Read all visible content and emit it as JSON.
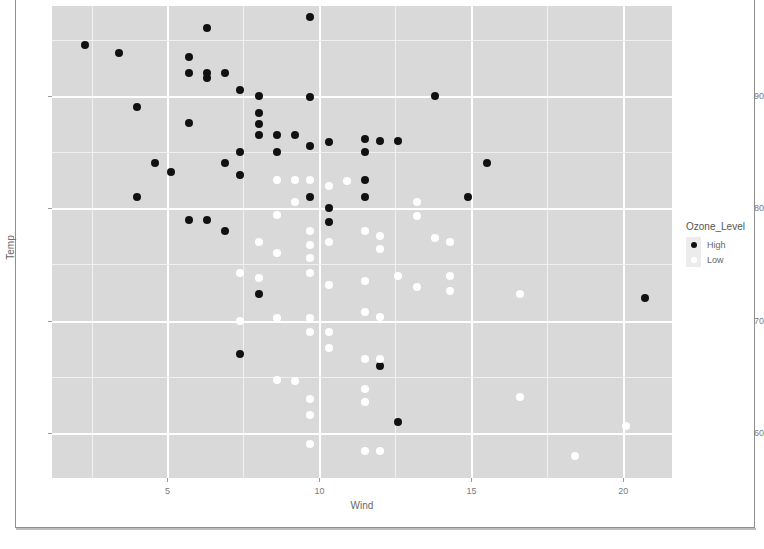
{
  "chart_data": {
    "type": "scatter",
    "title": "",
    "xlabel": "Wind",
    "ylabel": "Temp",
    "xlim": [
      1.2,
      21.6
    ],
    "ylim": [
      56.0,
      98.0
    ],
    "xticks": [
      5,
      10,
      15,
      20
    ],
    "yticks": [
      60,
      70,
      80,
      90
    ],
    "grid": true,
    "legend": {
      "title": "Ozone_Level",
      "position": "right",
      "entries": [
        {
          "label": "High",
          "color": "#111111"
        },
        {
          "label": "Low",
          "color": "#ffffff"
        }
      ]
    },
    "series": [
      {
        "name": "High",
        "color": "#111111",
        "points": [
          [
            2.3,
            94.5
          ],
          [
            3.4,
            93.8
          ],
          [
            4.0,
            89.0
          ],
          [
            4.6,
            84.0
          ],
          [
            5.1,
            83.2
          ],
          [
            4.0,
            81.0
          ],
          [
            5.7,
            93.5
          ],
          [
            5.7,
            92.0
          ],
          [
            5.7,
            87.6
          ],
          [
            6.3,
            96.0
          ],
          [
            6.3,
            92.0
          ],
          [
            6.3,
            91.6
          ],
          [
            6.9,
            92.0
          ],
          [
            6.9,
            84.0
          ],
          [
            5.7,
            79.0
          ],
          [
            6.3,
            79.0
          ],
          [
            6.9,
            78.0
          ],
          [
            7.4,
            90.5
          ],
          [
            8.0,
            90.0
          ],
          [
            8.0,
            88.5
          ],
          [
            8.0,
            87.5
          ],
          [
            8.0,
            86.5
          ],
          [
            8.6,
            86.5
          ],
          [
            8.6,
            85.0
          ],
          [
            9.2,
            86.5
          ],
          [
            9.7,
            97.0
          ],
          [
            9.7,
            89.9
          ],
          [
            9.7,
            85.5
          ],
          [
            9.7,
            81.0
          ],
          [
            10.3,
            85.9
          ],
          [
            10.3,
            80.0
          ],
          [
            10.3,
            78.8
          ],
          [
            7.4,
            85.0
          ],
          [
            7.4,
            83.0
          ],
          [
            8.0,
            72.4
          ],
          [
            7.4,
            67.0
          ],
          [
            11.5,
            86.2
          ],
          [
            11.5,
            85.0
          ],
          [
            12.0,
            86.0
          ],
          [
            12.6,
            86.0
          ],
          [
            11.5,
            82.5
          ],
          [
            11.5,
            81.0
          ],
          [
            12.0,
            66.0
          ],
          [
            12.6,
            61.0
          ],
          [
            13.8,
            90.0
          ],
          [
            15.5,
            84.0
          ],
          [
            14.9,
            81.0
          ],
          [
            20.7,
            72.0
          ]
        ]
      },
      {
        "name": "Low",
        "color": "#ffffff",
        "points": [
          [
            8.6,
            82.5
          ],
          [
            9.2,
            82.5
          ],
          [
            9.7,
            82.5
          ],
          [
            10.3,
            82.0
          ],
          [
            10.9,
            82.4
          ],
          [
            9.2,
            80.6
          ],
          [
            8.6,
            79.4
          ],
          [
            8.0,
            77.0
          ],
          [
            8.6,
            76.0
          ],
          [
            9.7,
            78.0
          ],
          [
            9.7,
            76.7
          ],
          [
            9.7,
            75.6
          ],
          [
            9.7,
            74.2
          ],
          [
            10.3,
            77.0
          ],
          [
            11.5,
            78.0
          ],
          [
            12.0,
            77.5
          ],
          [
            12.0,
            76.4
          ],
          [
            7.4,
            74.2
          ],
          [
            8.0,
            73.8
          ],
          [
            10.3,
            73.2
          ],
          [
            11.5,
            73.5
          ],
          [
            12.6,
            74.0
          ],
          [
            13.2,
            73.0
          ],
          [
            14.3,
            74.0
          ],
          [
            14.3,
            72.6
          ],
          [
            16.6,
            72.4
          ],
          [
            7.4,
            70.0
          ],
          [
            8.6,
            70.2
          ],
          [
            9.7,
            70.2
          ],
          [
            9.7,
            69.0
          ],
          [
            10.3,
            69.0
          ],
          [
            10.3,
            67.6
          ],
          [
            11.5,
            70.8
          ],
          [
            12.0,
            70.3
          ],
          [
            8.6,
            64.7
          ],
          [
            9.2,
            64.6
          ],
          [
            11.5,
            66.6
          ],
          [
            12.0,
            66.6
          ],
          [
            9.7,
            63.0
          ],
          [
            9.7,
            61.6
          ],
          [
            11.5,
            63.9
          ],
          [
            11.5,
            62.8
          ],
          [
            16.6,
            63.2
          ],
          [
            9.7,
            59.0
          ],
          [
            11.5,
            58.4
          ],
          [
            12.0,
            58.4
          ],
          [
            18.4,
            58.0
          ],
          [
            20.1,
            60.6
          ],
          [
            13.8,
            77.4
          ],
          [
            14.3,
            77.0
          ],
          [
            13.2,
            80.6
          ],
          [
            13.2,
            79.3
          ]
        ]
      }
    ]
  }
}
